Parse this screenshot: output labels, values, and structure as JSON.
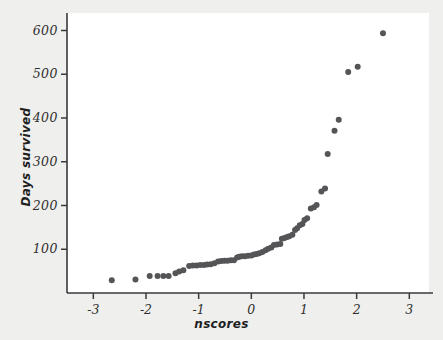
{
  "chart_data": {
    "type": "scatter",
    "title": "",
    "xlabel": "nscores",
    "ylabel": "Days survived",
    "xlim": [
      -3.5,
      3.45
    ],
    "ylim": [
      0,
      640
    ],
    "grid": false,
    "legend": null,
    "xticks": [
      -3,
      -2,
      -1,
      0,
      1,
      2,
      3
    ],
    "xticklabels": [
      "-3",
      "-2",
      "-1",
      "0",
      "1",
      "2",
      "3"
    ],
    "yticks": [
      100,
      200,
      300,
      400,
      500,
      600
    ],
    "yticklabels": [
      "100",
      "200",
      "300",
      "400",
      "500",
      "600"
    ],
    "marker": "filled-circle",
    "marker_color": "#555558",
    "marker_size": 3.0,
    "point_count": 61,
    "points": [
      {
        "x": -2.65,
        "y": 29
      },
      {
        "x": -2.2,
        "y": 31
      },
      {
        "x": -1.93,
        "y": 39
      },
      {
        "x": -1.78,
        "y": 39
      },
      {
        "x": -1.67,
        "y": 39
      },
      {
        "x": -1.57,
        "y": 39
      },
      {
        "x": -1.44,
        "y": 45
      },
      {
        "x": -1.37,
        "y": 49
      },
      {
        "x": -1.29,
        "y": 52
      },
      {
        "x": -1.18,
        "y": 62
      },
      {
        "x": -1.11,
        "y": 63
      },
      {
        "x": -1.04,
        "y": 63
      },
      {
        "x": -0.97,
        "y": 64
      },
      {
        "x": -0.9,
        "y": 64
      },
      {
        "x": -0.84,
        "y": 65
      },
      {
        "x": -0.77,
        "y": 66
      },
      {
        "x": -0.7,
        "y": 68
      },
      {
        "x": -0.63,
        "y": 72
      },
      {
        "x": -0.57,
        "y": 73
      },
      {
        "x": -0.51,
        "y": 74
      },
      {
        "x": -0.45,
        "y": 74
      },
      {
        "x": -0.39,
        "y": 75
      },
      {
        "x": -0.33,
        "y": 75
      },
      {
        "x": -0.27,
        "y": 81
      },
      {
        "x": -0.23,
        "y": 83
      },
      {
        "x": -0.18,
        "y": 84
      },
      {
        "x": -0.12,
        "y": 84
      },
      {
        "x": -0.06,
        "y": 85
      },
      {
        "x": 0.0,
        "y": 86
      },
      {
        "x": 0.05,
        "y": 88
      },
      {
        "x": 0.1,
        "y": 89
      },
      {
        "x": 0.15,
        "y": 91
      },
      {
        "x": 0.21,
        "y": 94
      },
      {
        "x": 0.27,
        "y": 98
      },
      {
        "x": 0.32,
        "y": 101
      },
      {
        "x": 0.38,
        "y": 104
      },
      {
        "x": 0.43,
        "y": 110
      },
      {
        "x": 0.49,
        "y": 111
      },
      {
        "x": 0.55,
        "y": 112
      },
      {
        "x": 0.58,
        "y": 124
      },
      {
        "x": 0.63,
        "y": 126
      },
      {
        "x": 0.68,
        "y": 128
      },
      {
        "x": 0.72,
        "y": 130
      },
      {
        "x": 0.78,
        "y": 133
      },
      {
        "x": 0.83,
        "y": 144
      },
      {
        "x": 0.87,
        "y": 148
      },
      {
        "x": 0.92,
        "y": 155
      },
      {
        "x": 0.97,
        "y": 158
      },
      {
        "x": 1.01,
        "y": 167
      },
      {
        "x": 1.06,
        "y": 171
      },
      {
        "x": 1.13,
        "y": 193
      },
      {
        "x": 1.19,
        "y": 196
      },
      {
        "x": 1.24,
        "y": 201
      },
      {
        "x": 1.33,
        "y": 232
      },
      {
        "x": 1.4,
        "y": 239
      },
      {
        "x": 1.45,
        "y": 318
      },
      {
        "x": 1.58,
        "y": 371
      },
      {
        "x": 1.66,
        "y": 396
      },
      {
        "x": 1.84,
        "y": 505
      },
      {
        "x": 2.02,
        "y": 517
      },
      {
        "x": 2.5,
        "y": 594
      }
    ]
  },
  "figure": {
    "background_color": "#efefee",
    "plot_background_color": "#ffffff",
    "axis_color": "#3a3a3a"
  }
}
